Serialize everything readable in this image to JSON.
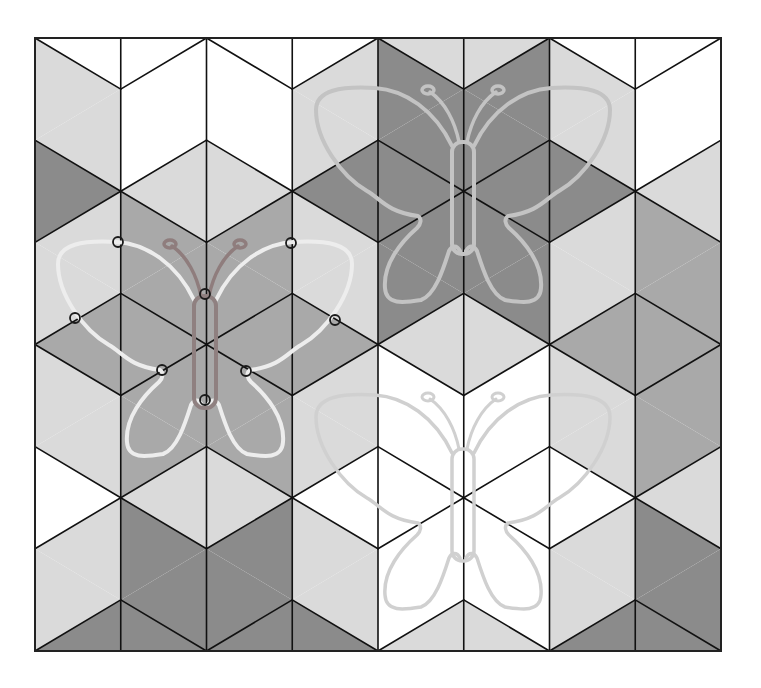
{
  "canvas": {
    "width": 761,
    "height": 688
  },
  "grid": {
    "x0": 35,
    "y0": 38,
    "col_width": 85.75,
    "row_step": 51.08,
    "columns": 8,
    "steps": 12,
    "omitted_edge_rule": "zigzag edge k->k+1 omitted when k % 3 == 1",
    "palette": {
      "W": "#ffffff",
      "L": "#dadada",
      "M": "#a9a9a9",
      "D": "#8b8b8b"
    },
    "line_color": "#111111",
    "columns_colors": [
      "WLLDLLMLLWLLD",
      "WWWLMMMMMLDDD",
      "WWWLMMMMMLDDD",
      "WLLDLLMLLWLLD",
      "LDDDDDLWWWWWL",
      "LDDDDDLWWWWWL",
      "WLLDLLMLLWLLD",
      "WWWLMMMMMLDDD"
    ]
  },
  "butterflies": [
    {
      "id": "top",
      "cx": 463,
      "cy": 88,
      "wing_color": "#c3c3c3",
      "body_color": "#c3c3c3",
      "antenna_color": "#c3c3c3",
      "stroke_width": 4,
      "markers": false
    },
    {
      "id": "left",
      "cx": 205,
      "cy": 242,
      "wing_color": "#ededed",
      "body_color": "#8f8080",
      "antenna_color": "#8f7d7d",
      "stroke_width": 4,
      "markers": true
    },
    {
      "id": "bottom",
      "cx": 463,
      "cy": 395,
      "wing_color": "#d0d0d0",
      "body_color": "#d0d0d0",
      "antenna_color": "#d0d0d0",
      "stroke_width": 3.5,
      "markers": false
    }
  ],
  "markers": [
    {
      "x": 118,
      "y": 242
    },
    {
      "x": 75,
      "y": 318
    },
    {
      "x": 162,
      "y": 370
    },
    {
      "x": 205,
      "y": 294
    },
    {
      "x": 205,
      "y": 400
    },
    {
      "x": 291,
      "y": 243
    },
    {
      "x": 335,
      "y": 320
    },
    {
      "x": 246,
      "y": 371
    }
  ]
}
